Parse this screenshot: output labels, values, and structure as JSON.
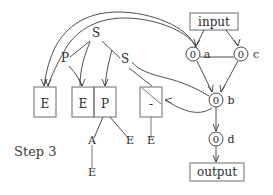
{
  "figure": {
    "step_label": "Step 3",
    "io": {
      "input_label": "input",
      "output_label": "output"
    },
    "graph_nodes": [
      {
        "id": "a",
        "value": "0",
        "label": "a"
      },
      {
        "id": "c",
        "value": "0",
        "label": "c"
      },
      {
        "id": "b",
        "value": "0",
        "label": "b"
      },
      {
        "id": "d",
        "value": "0",
        "label": "d"
      }
    ],
    "tree_symbols": {
      "top_s": "S",
      "left_p": "P",
      "right_s": "S"
    },
    "boxes": [
      {
        "id": "box-1",
        "content": "E"
      },
      {
        "id": "box-2",
        "content": "E"
      },
      {
        "id": "box-3",
        "content": "P"
      },
      {
        "id": "box-4",
        "content": "-"
      }
    ],
    "leaves": [
      {
        "id": "leaf-a",
        "content": "A"
      },
      {
        "id": "leaf-e-under-a",
        "content": "E"
      },
      {
        "id": "leaf-e-right-of-p",
        "content": "E"
      },
      {
        "id": "leaf-e-under-dash",
        "content": "E"
      }
    ],
    "colors": {
      "stroke": "#3a3a3a",
      "box_stroke": "#777777",
      "text": "#2b2b2b",
      "background": "#ffffff"
    }
  }
}
